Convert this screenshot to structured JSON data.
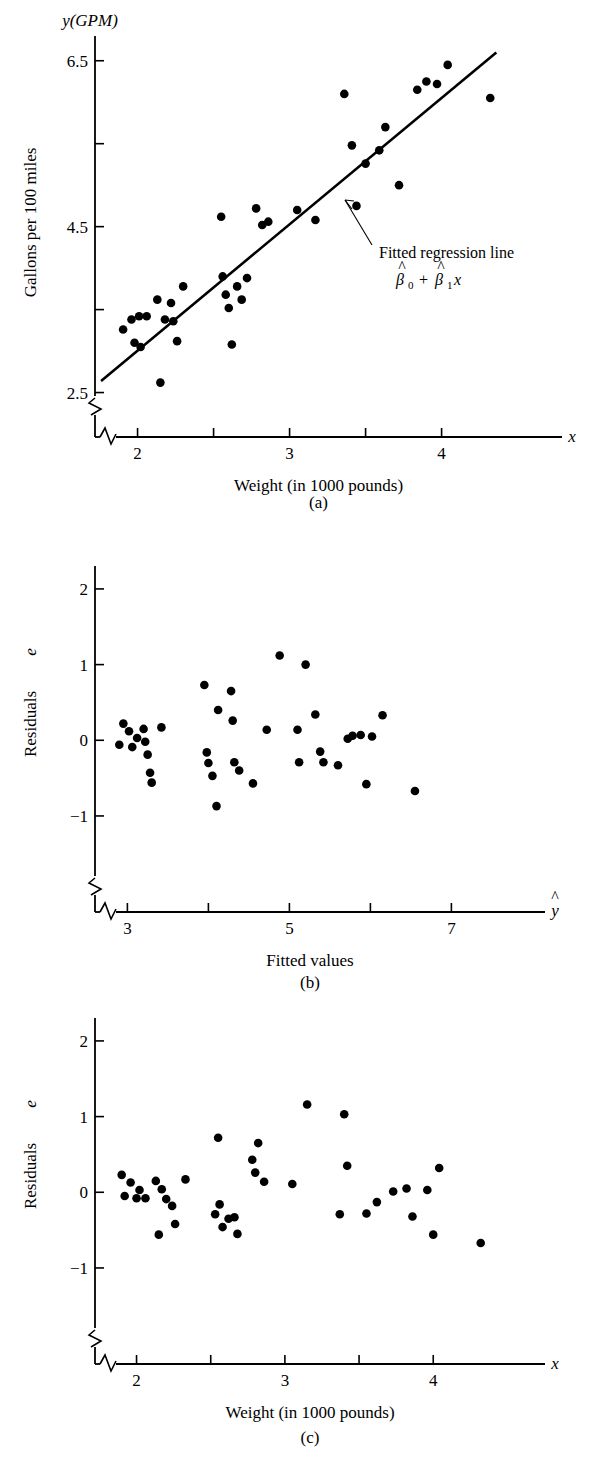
{
  "figure": {
    "panels": [
      {
        "id": "a",
        "caption": "(a)",
        "ylabel": "Gallons per 100 miles",
        "y_axis_var": "y(GPM)",
        "xlabel": "Weight (in 1000 pounds)",
        "x_axis_var": "x",
        "annotation_line1": "Fitted regression line",
        "annotation_beta0": "β",
        "annotation_beta0_sub": "0",
        "annotation_plus": "+",
        "annotation_beta1": "β",
        "annotation_beta1_sub": "1",
        "annotation_beta1_x": "x",
        "y_ticks": [
          {
            "value": 6.5,
            "label": "6.5"
          },
          {
            "value": 5.5,
            "label": ""
          },
          {
            "value": 4.5,
            "label": "4.5"
          },
          {
            "value": 3.5,
            "label": ""
          },
          {
            "value": 2.5,
            "label": "2.5"
          }
        ],
        "x_ticks": [
          {
            "value": 2.0,
            "label": "2"
          },
          {
            "value": 2.5,
            "label": ""
          },
          {
            "value": 3.0,
            "label": "3"
          },
          {
            "value": 3.5,
            "label": ""
          },
          {
            "value": 4.0,
            "label": "4"
          }
        ]
      },
      {
        "id": "b",
        "caption": "(b)",
        "ylabel": "Residuals e",
        "ylabel_text": "Residuals",
        "ylabel_var": "e",
        "xlabel": "Fitted values",
        "x_axis_var": "ŷ",
        "y_ticks": [
          {
            "value": 2,
            "label": "2"
          },
          {
            "value": 1,
            "label": "1"
          },
          {
            "value": 0,
            "label": "0"
          },
          {
            "value": -1,
            "label": "−1"
          }
        ],
        "x_ticks": [
          {
            "value": 3,
            "label": "3"
          },
          {
            "value": 4,
            "label": ""
          },
          {
            "value": 5,
            "label": "5"
          },
          {
            "value": 6,
            "label": ""
          },
          {
            "value": 7,
            "label": "7"
          }
        ]
      },
      {
        "id": "c",
        "caption": "(c)",
        "ylabel": "Residuals e",
        "ylabel_text": "Residuals",
        "ylabel_var": "e",
        "xlabel": "Weight (in 1000 pounds)",
        "x_axis_var": "x",
        "y_ticks": [
          {
            "value": 2,
            "label": "2"
          },
          {
            "value": 1,
            "label": "1"
          },
          {
            "value": 0,
            "label": "0"
          },
          {
            "value": -1,
            "label": "−1"
          }
        ],
        "x_ticks": [
          {
            "value": 2.0,
            "label": "2"
          },
          {
            "value": 2.5,
            "label": ""
          },
          {
            "value": 3.0,
            "label": "3"
          },
          {
            "value": 3.5,
            "label": ""
          },
          {
            "value": 4.0,
            "label": "4"
          }
        ]
      }
    ]
  },
  "chart_data": [
    {
      "type": "scatter",
      "panel": "a",
      "title": "",
      "xlabel": "Weight (in 1000 pounds)",
      "ylabel": "Gallons per 100 miles",
      "xlim": [
        1.72,
        4.45
      ],
      "ylim": [
        2.35,
        6.75
      ],
      "grid": false,
      "legend": false,
      "axis_break_x": true,
      "axis_break_y": true,
      "x": [
        1.905,
        1.96,
        2.01,
        2.06,
        1.98,
        2.02,
        2.13,
        2.15,
        2.22,
        2.235,
        2.18,
        2.26,
        2.3,
        2.55,
        2.56,
        2.58,
        2.6,
        2.62,
        2.655,
        2.685,
        2.72,
        2.78,
        2.82,
        2.86,
        3.05,
        3.17,
        3.36,
        3.41,
        3.44,
        3.5,
        3.59,
        3.63,
        3.72,
        3.84,
        3.9,
        3.97,
        4.04,
        4.32
      ],
      "y": [
        3.26,
        3.38,
        3.42,
        3.42,
        3.1,
        3.05,
        3.62,
        2.62,
        3.58,
        3.36,
        3.38,
        3.12,
        3.78,
        4.62,
        3.9,
        3.68,
        3.52,
        3.08,
        3.78,
        3.62,
        3.88,
        4.72,
        4.52,
        4.56,
        4.7,
        4.58,
        6.1,
        5.48,
        4.75,
        5.26,
        5.42,
        5.7,
        5.0,
        6.15,
        6.25,
        6.22,
        6.45,
        6.05
      ],
      "regression_line": {
        "label": "Fitted regression line",
        "equation": "β̅0 + β̅1x",
        "x_start": 1.76,
        "y_start": 2.64,
        "x_end": 4.36,
        "y_end": 6.6
      }
    },
    {
      "type": "scatter",
      "panel": "b",
      "title": "",
      "xlabel": "Fitted values",
      "ylabel": "Residuals e",
      "xlim": [
        2.6,
        7.6
      ],
      "ylim": [
        -1.45,
        2.25
      ],
      "grid": false,
      "legend": false,
      "axis_break_x": true,
      "axis_break_y": true,
      "x": [
        2.9,
        2.95,
        3.02,
        3.06,
        3.12,
        3.2,
        3.22,
        3.25,
        3.28,
        3.3,
        3.42,
        3.95,
        3.98,
        4.0,
        4.05,
        4.1,
        4.12,
        4.28,
        4.3,
        4.32,
        4.38,
        4.55,
        4.72,
        4.88,
        5.1,
        5.12,
        5.2,
        5.32,
        5.38,
        5.42,
        5.6,
        5.72,
        5.78,
        5.88,
        5.95,
        6.02,
        6.15,
        6.55
      ],
      "y": [
        -0.06,
        0.22,
        0.12,
        -0.09,
        0.03,
        0.15,
        -0.02,
        -0.19,
        -0.43,
        -0.56,
        0.17,
        0.73,
        -0.16,
        -0.3,
        -0.47,
        -0.87,
        0.4,
        0.65,
        0.26,
        -0.29,
        -0.4,
        -0.57,
        0.14,
        1.12,
        0.14,
        -0.29,
        1.0,
        0.34,
        -0.15,
        -0.29,
        -0.33,
        0.02,
        0.06,
        0.07,
        -0.58,
        0.05,
        0.33,
        -0.67
      ]
    },
    {
      "type": "scatter",
      "panel": "c",
      "title": "",
      "xlabel": "Weight (in 1000 pounds)",
      "ylabel": "Residuals e",
      "xlim": [
        1.72,
        4.45
      ],
      "ylim": [
        -1.45,
        2.25
      ],
      "grid": false,
      "legend": false,
      "axis_break_x": true,
      "axis_break_y": true,
      "x": [
        1.9,
        1.92,
        1.96,
        2.0,
        2.02,
        2.06,
        2.13,
        2.15,
        2.17,
        2.2,
        2.24,
        2.26,
        2.33,
        2.53,
        2.55,
        2.56,
        2.58,
        2.62,
        2.66,
        2.68,
        2.78,
        2.8,
        2.82,
        2.86,
        3.05,
        3.15,
        3.37,
        3.4,
        3.42,
        3.55,
        3.62,
        3.73,
        3.82,
        3.86,
        3.96,
        4.0,
        4.04,
        4.32
      ],
      "y": [
        0.23,
        -0.05,
        0.13,
        -0.08,
        0.03,
        -0.08,
        0.15,
        -0.56,
        0.04,
        -0.09,
        -0.18,
        -0.42,
        0.17,
        -0.29,
        0.72,
        -0.16,
        -0.46,
        -0.35,
        -0.33,
        -0.55,
        0.43,
        0.26,
        0.65,
        0.14,
        0.11,
        1.16,
        -0.29,
        1.03,
        0.35,
        -0.28,
        -0.13,
        0.01,
        0.05,
        -0.32,
        0.03,
        -0.56,
        0.32,
        -0.67
      ]
    }
  ]
}
